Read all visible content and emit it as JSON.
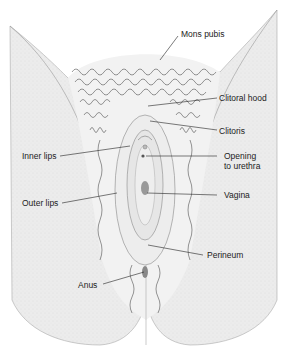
{
  "diagram": {
    "labels": {
      "mons_pubis": "Mons pubis",
      "clitoral_hood": "Clitoral hood",
      "clitoris": "Clitoris",
      "inner_lips": "Inner lips",
      "opening_urethra_1": "Opening",
      "opening_urethra_2": "to urethra",
      "outer_lips": "Outer lips",
      "vagina": "Vagina",
      "perineum": "Perineum",
      "anus": "Anus"
    }
  }
}
